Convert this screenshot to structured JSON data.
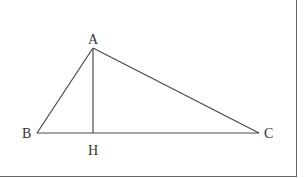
{
  "diagram": {
    "type": "geometry",
    "points": {
      "A": {
        "label": "A",
        "x": 93,
        "y": 48
      },
      "B": {
        "label": "B",
        "x": 37,
        "y": 133
      },
      "C": {
        "label": "C",
        "x": 259,
        "y": 133
      },
      "H": {
        "label": "H",
        "x": 93,
        "y": 133
      }
    },
    "segments": [
      "AB",
      "AC",
      "BC",
      "AH"
    ],
    "colors": {
      "line": "#4a4a4a",
      "frame": "#555555",
      "text": "#333333"
    }
  }
}
